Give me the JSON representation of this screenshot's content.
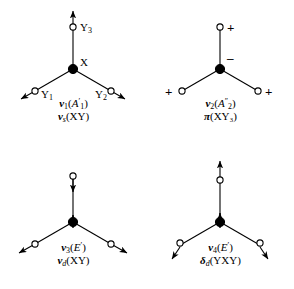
{
  "figure": {
    "colors": {
      "stroke": "#000000",
      "background": "#ffffff",
      "atom_fill_center": "#000000",
      "atom_fill_outer": "#ffffff"
    }
  },
  "panels": [
    {
      "id": "panel-1",
      "mode_symbol": "ν",
      "mode_index": "1",
      "symmetry_species": "A′1",
      "symmetry_letter": "A",
      "symmetry_prime": "′",
      "symmetry_subscript": "1",
      "description_symbol": "ν",
      "description_subscript": "s",
      "description_group": "(XY)",
      "atoms": [
        {
          "label": "X",
          "kind": "center",
          "marker": "filled-circle"
        },
        {
          "label": "Y₃",
          "kind": "outer",
          "marker": "open-circle"
        },
        {
          "label": "Y₁",
          "kind": "outer",
          "marker": "open-circle"
        },
        {
          "label": "Y₂",
          "kind": "outer",
          "marker": "open-circle"
        }
      ],
      "arrows": "three outward radial arrows on Y atoms",
      "signs": []
    },
    {
      "id": "panel-2",
      "mode_symbol": "ν",
      "mode_index": "2",
      "symmetry_species": "A″2",
      "symmetry_letter": "A",
      "symmetry_prime": "″",
      "symmetry_subscript": "2",
      "description_symbol": "π",
      "description_subscript": "",
      "description_group": "(XY₃)",
      "atoms": [
        {
          "label": "",
          "kind": "center",
          "marker": "filled-circle"
        },
        {
          "label": "",
          "kind": "outer",
          "marker": "open-circle"
        },
        {
          "label": "",
          "kind": "outer",
          "marker": "open-circle"
        },
        {
          "label": "",
          "kind": "outer",
          "marker": "open-circle"
        }
      ],
      "arrows": "none",
      "signs": [
        {
          "text": "+",
          "position": "top-right of upper Y"
        },
        {
          "text": "−",
          "position": "right of center X"
        },
        {
          "text": "+",
          "position": "left of lower-left Y"
        },
        {
          "text": "+",
          "position": "right of lower-right Y"
        }
      ]
    },
    {
      "id": "panel-3",
      "mode_symbol": "ν",
      "mode_index": "3",
      "symmetry_species": "E′",
      "symmetry_letter": "E",
      "symmetry_prime": "′",
      "symmetry_subscript": "",
      "description_symbol": "ν",
      "description_subscript": "d",
      "description_group": "(XY)",
      "atoms": [
        {
          "label": "",
          "kind": "center",
          "marker": "filled-circle"
        },
        {
          "label": "",
          "kind": "outer",
          "marker": "open-circle"
        },
        {
          "label": "",
          "kind": "outer",
          "marker": "open-circle"
        },
        {
          "label": "",
          "kind": "outer",
          "marker": "open-circle"
        }
      ],
      "arrows": "top Y downward, center X upward, lower Y atoms outward",
      "signs": []
    },
    {
      "id": "panel-4",
      "mode_symbol": "ν",
      "mode_index": "4",
      "symmetry_species": "E′",
      "symmetry_letter": "E",
      "symmetry_prime": "′",
      "symmetry_subscript": "",
      "description_symbol": "δ",
      "description_subscript": "d",
      "description_group": "(YXY)",
      "atoms": [
        {
          "label": "",
          "kind": "center",
          "marker": "filled-circle"
        },
        {
          "label": "",
          "kind": "outer",
          "marker": "open-circle"
        },
        {
          "label": "",
          "kind": "outer",
          "marker": "open-circle"
        },
        {
          "label": "",
          "kind": "outer",
          "marker": "open-circle"
        }
      ],
      "arrows": "top Y upward, center X upward, lower Y atoms downward-outward",
      "signs": []
    }
  ]
}
